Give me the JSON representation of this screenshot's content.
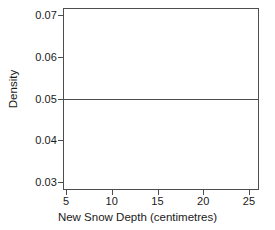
{
  "chart_data": {
    "type": "bar",
    "title": "",
    "subtitle": "",
    "xlabel": "New Snow Depth (centimetres)",
    "ylabel": "Density",
    "xlim": [
      5,
      25
    ],
    "ylim": [
      0.03,
      0.07
    ],
    "xticks": [
      5,
      10,
      15,
      20,
      25
    ],
    "xtick_labels": [
      "5",
      "10",
      "15",
      "20",
      "25"
    ],
    "yticks": [
      0.03,
      0.04,
      0.05,
      0.06,
      0.07
    ],
    "ytick_labels": [
      "0.03",
      "0.04",
      "0.05",
      "0.06",
      "0.07"
    ],
    "grid": false,
    "legend": null,
    "legend_position": "none",
    "annotations": [],
    "bin_edges": [
      5,
      25
    ],
    "categories": [
      "5-25"
    ],
    "values": [
      0.05
    ],
    "bars": [
      {
        "label": "5-25",
        "x_start": 5,
        "x_end": 25,
        "density": 0.05
      }
    ],
    "series": [
      {
        "name": "Density",
        "values": [
          0.05
        ]
      }
    ],
    "colors": {
      "bar_edge": "#4d4d4d",
      "bar_fill": "none",
      "axis": "#4d4d4d",
      "text": "#1a1a1a",
      "background": "#ffffff"
    }
  }
}
